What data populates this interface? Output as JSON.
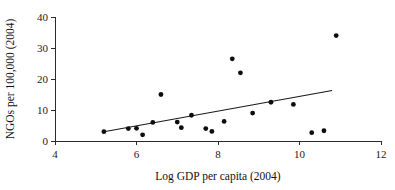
{
  "chart_data": {
    "type": "scatter",
    "title": "",
    "xlabel": "Log GDP per capita (2004)",
    "ylabel": "NGOs per 100,000 (2004)",
    "xlim": [
      4,
      12
    ],
    "ylim": [
      0,
      40
    ],
    "xticks": [
      4,
      6,
      8,
      10,
      12
    ],
    "yticks": [
      0,
      10,
      20,
      30,
      40
    ],
    "xtick_labels": [
      "4",
      "6",
      "8",
      "10",
      "12"
    ],
    "ytick_labels": [
      "0",
      "10",
      "20",
      "30",
      "40"
    ],
    "grid": false,
    "legend": false,
    "legend_position": "none",
    "point_color": "#0d0d0d",
    "line_color": "#1a1a1a",
    "axis_color": "#2b2b2b",
    "points": [
      {
        "x": 5.2,
        "y": 3.0
      },
      {
        "x": 5.8,
        "y": 4.0
      },
      {
        "x": 6.0,
        "y": 4.1
      },
      {
        "x": 6.15,
        "y": 2.0
      },
      {
        "x": 6.4,
        "y": 6.0
      },
      {
        "x": 6.6,
        "y": 15.0
      },
      {
        "x": 7.0,
        "y": 6.1
      },
      {
        "x": 7.1,
        "y": 4.3
      },
      {
        "x": 7.35,
        "y": 8.3
      },
      {
        "x": 7.7,
        "y": 4.0
      },
      {
        "x": 7.85,
        "y": 3.1
      },
      {
        "x": 8.15,
        "y": 6.3
      },
      {
        "x": 8.35,
        "y": 26.5
      },
      {
        "x": 8.55,
        "y": 22.0
      },
      {
        "x": 8.85,
        "y": 9.0
      },
      {
        "x": 9.3,
        "y": 12.5
      },
      {
        "x": 9.85,
        "y": 11.8
      },
      {
        "x": 10.3,
        "y": 2.7
      },
      {
        "x": 10.6,
        "y": 3.3
      },
      {
        "x": 10.9,
        "y": 34.0
      }
    ],
    "fit_line": {
      "name": "linear fit",
      "x_start": 5.2,
      "y_start": 3.0,
      "x_end": 10.8,
      "y_end": 16.3
    }
  }
}
